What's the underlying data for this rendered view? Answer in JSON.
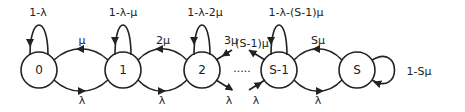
{
  "diagram": {
    "type": "markov-chain-birth-death",
    "nodes": [
      {
        "id": "0",
        "label": "0",
        "self_loop": "1-λ"
      },
      {
        "id": "1",
        "label": "1",
        "self_loop": "1-λ-μ"
      },
      {
        "id": "2",
        "label": "2",
        "self_loop": "1-λ-2μ"
      },
      {
        "id": "S-1",
        "label": "S-1",
        "self_loop": "1-λ-(S-1)μ"
      },
      {
        "id": "S",
        "label": "S",
        "self_loop": "1-Sμ"
      }
    ],
    "edges": [
      {
        "from": "1",
        "to": "0",
        "label": "μ"
      },
      {
        "from": "0",
        "to": "1",
        "label": "λ"
      },
      {
        "from": "2",
        "to": "1",
        "label": "2μ"
      },
      {
        "from": "1",
        "to": "2",
        "label": "λ"
      },
      {
        "from": "3",
        "to": "2",
        "label": "3μ"
      },
      {
        "from": "2",
        "to": "3",
        "label": "λ"
      },
      {
        "from": "S-1",
        "to": "S-2",
        "label": "(S-1)μ"
      },
      {
        "from": "S-2",
        "to": "S-1",
        "label": "λ"
      },
      {
        "from": "S",
        "to": "S-1",
        "label": "Sμ"
      },
      {
        "from": "S-1",
        "to": "S",
        "label": "λ"
      }
    ],
    "ellipsis": "....."
  }
}
